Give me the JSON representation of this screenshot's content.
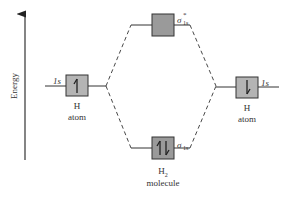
{
  "axis": {
    "label": "Energy",
    "direction": "up"
  },
  "left_atom": {
    "orbital_label": "1s",
    "name_line1": "H",
    "name_line2": "atom",
    "electrons": "up",
    "electron_glyph": "↿"
  },
  "right_atom": {
    "orbital_label": "1s",
    "name_line1": "H",
    "name_line2": "atom",
    "electrons": "down",
    "electron_glyph": "⇂"
  },
  "antibonding": {
    "symbol": "σ",
    "subscript": "1s",
    "superscript": "*",
    "electrons": "none"
  },
  "bonding": {
    "symbol": "σ",
    "subscript": "1s",
    "electrons": "paired",
    "electron_glyph": "⥮"
  },
  "molecule": {
    "name_main": "H",
    "name_sub": "2",
    "name_line2": "molecule"
  },
  "colors": {
    "box_fill_atom": "#b4b4b4",
    "box_fill_mo": "#9a9a9a",
    "line": "#333333",
    "text": "#333333"
  }
}
